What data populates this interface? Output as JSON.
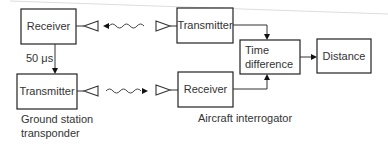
{
  "diagram": {
    "blocks": {
      "ground_receiver": "Receiver",
      "ground_transmitter": "Transmitter",
      "aircraft_transmitter": "Transmitter",
      "aircraft_receiver": "Receiver",
      "time_difference_line1": "Time",
      "time_difference_line2": "difference",
      "distance": "Distance"
    },
    "delay_label": "50 μs",
    "captions": {
      "ground_line1": "Ground station",
      "ground_line2": "transponder",
      "aircraft": "Aircraft interrogator"
    },
    "icons": [
      "antenna-icon",
      "radio-wave-icon",
      "arrow-icon"
    ]
  }
}
